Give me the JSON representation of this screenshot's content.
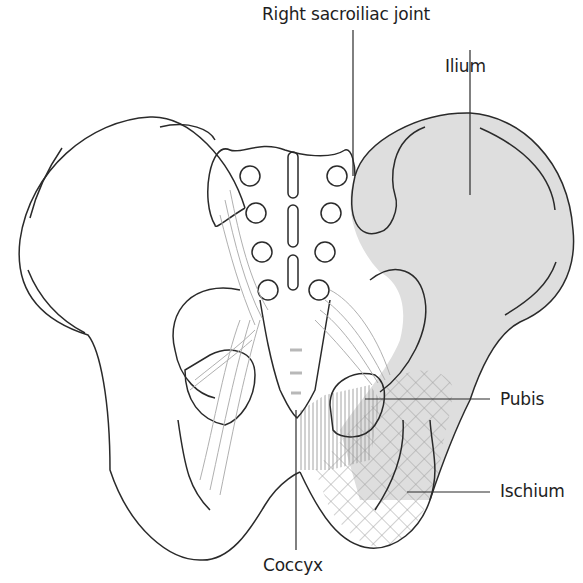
{
  "diagram": {
    "labels": {
      "sacroiliac": "Right sacroiliac joint",
      "ilium": "Ilium",
      "pubis": "Pubis",
      "ischium": "Ischium",
      "coccyx": "Coccyx"
    },
    "colors": {
      "outline": "#2a2a2a",
      "ilium_fill": "#dcdcdc",
      "ligament": "#a8a8a8",
      "hatch": "#9a9a9a"
    }
  }
}
